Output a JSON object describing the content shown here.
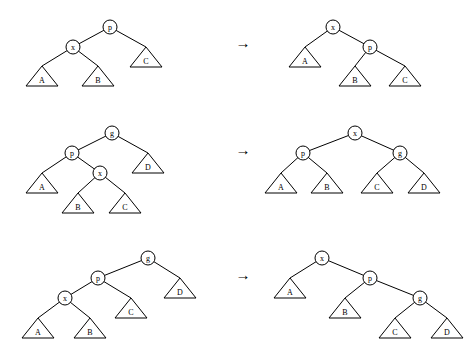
{
  "figure": {
    "title": "",
    "rows": [
      {
        "id": "case-1",
        "arrow": "→",
        "before": {
          "nodes": [
            {
              "id": "p",
              "label": "p",
              "cx": 110,
              "cy": 27
            },
            {
              "id": "x",
              "label": "x",
              "cx": 73,
              "cy": 47
            },
            {
              "id": "A",
              "label": "A",
              "cx": 42,
              "cy": 76,
              "shape": "triangle"
            },
            {
              "id": "B",
              "label": "B",
              "cx": 98,
              "cy": 76,
              "shape": "triangle"
            },
            {
              "id": "C",
              "label": "C",
              "cx": 146,
              "cy": 57,
              "shape": "triangle"
            }
          ],
          "edges": [
            [
              "p",
              "x"
            ],
            [
              "p",
              "C"
            ],
            [
              "x",
              "A"
            ],
            [
              "x",
              "B"
            ]
          ]
        },
        "after": {
          "nodes": [
            {
              "id": "x",
              "label": "x",
              "cx": 333,
              "cy": 27
            },
            {
              "id": "p",
              "label": "p",
              "cx": 370,
              "cy": 47
            },
            {
              "id": "A",
              "label": "A",
              "cx": 305,
              "cy": 57,
              "shape": "triangle"
            },
            {
              "id": "B",
              "label": "B",
              "cx": 355,
              "cy": 76,
              "shape": "triangle"
            },
            {
              "id": "C",
              "label": "C",
              "cx": 405,
              "cy": 76,
              "shape": "triangle"
            }
          ],
          "edges": [
            [
              "x",
              "A"
            ],
            [
              "x",
              "p"
            ],
            [
              "p",
              "B"
            ],
            [
              "p",
              "C"
            ]
          ]
        }
      },
      {
        "id": "case-2",
        "arrow": "→",
        "before": {
          "nodes": [
            {
              "id": "g",
              "label": "g",
              "cx": 112,
              "cy": 133
            },
            {
              "id": "p",
              "label": "p",
              "cx": 72,
              "cy": 153
            },
            {
              "id": "D",
              "label": "D",
              "cx": 148,
              "cy": 163,
              "shape": "triangle"
            },
            {
              "id": "A",
              "label": "A",
              "cx": 42,
              "cy": 183,
              "shape": "triangle"
            },
            {
              "id": "x",
              "label": "x",
              "cx": 100,
              "cy": 173
            },
            {
              "id": "B",
              "label": "B",
              "cx": 78,
              "cy": 203,
              "shape": "triangle"
            },
            {
              "id": "C",
              "label": "C",
              "cx": 125,
              "cy": 203,
              "shape": "triangle"
            }
          ],
          "edges": [
            [
              "g",
              "p"
            ],
            [
              "g",
              "D"
            ],
            [
              "p",
              "A"
            ],
            [
              "p",
              "x"
            ],
            [
              "x",
              "B"
            ],
            [
              "x",
              "C"
            ]
          ]
        },
        "after": {
          "nodes": [
            {
              "id": "x",
              "label": "x",
              "cx": 355,
              "cy": 133
            },
            {
              "id": "p",
              "label": "p",
              "cx": 303,
              "cy": 153
            },
            {
              "id": "g",
              "label": "g",
              "cx": 400,
              "cy": 153
            },
            {
              "id": "A",
              "label": "A",
              "cx": 281,
              "cy": 183,
              "shape": "triangle"
            },
            {
              "id": "B",
              "label": "B",
              "cx": 327,
              "cy": 183,
              "shape": "triangle"
            },
            {
              "id": "C",
              "label": "C",
              "cx": 377,
              "cy": 183,
              "shape": "triangle"
            },
            {
              "id": "D",
              "label": "D",
              "cx": 424,
              "cy": 183,
              "shape": "triangle"
            }
          ],
          "edges": [
            [
              "x",
              "p"
            ],
            [
              "x",
              "g"
            ],
            [
              "p",
              "A"
            ],
            [
              "p",
              "B"
            ],
            [
              "g",
              "C"
            ],
            [
              "g",
              "D"
            ]
          ]
        }
      },
      {
        "id": "case-3",
        "arrow": "→",
        "before": {
          "nodes": [
            {
              "id": "g",
              "label": "g",
              "cx": 148,
              "cy": 258
            },
            {
              "id": "p",
              "label": "p",
              "cx": 98,
              "cy": 278
            },
            {
              "id": "D",
              "label": "D",
              "cx": 180,
              "cy": 288,
              "shape": "triangle"
            },
            {
              "id": "x",
              "label": "x",
              "cx": 65,
              "cy": 298
            },
            {
              "id": "C",
              "label": "C",
              "cx": 131,
              "cy": 308,
              "shape": "triangle"
            },
            {
              "id": "A",
              "label": "A",
              "cx": 38,
              "cy": 328,
              "shape": "triangle"
            },
            {
              "id": "B",
              "label": "B",
              "cx": 90,
              "cy": 328,
              "shape": "triangle"
            }
          ],
          "edges": [
            [
              "g",
              "p"
            ],
            [
              "g",
              "D"
            ],
            [
              "p",
              "x"
            ],
            [
              "p",
              "C"
            ],
            [
              "x",
              "A"
            ],
            [
              "x",
              "B"
            ]
          ]
        },
        "after": {
          "nodes": [
            {
              "id": "x",
              "label": "x",
              "cx": 322,
              "cy": 258
            },
            {
              "id": "A",
              "label": "A",
              "cx": 290,
              "cy": 288,
              "shape": "triangle"
            },
            {
              "id": "p",
              "label": "p",
              "cx": 370,
              "cy": 278
            },
            {
              "id": "B",
              "label": "B",
              "cx": 345,
              "cy": 308,
              "shape": "triangle"
            },
            {
              "id": "g",
              "label": "g",
              "cx": 420,
              "cy": 298
            },
            {
              "id": "C",
              "label": "C",
              "cx": 395,
              "cy": 328,
              "shape": "triangle"
            },
            {
              "id": "D",
              "label": "D",
              "cx": 447,
              "cy": 328,
              "shape": "triangle"
            }
          ],
          "edges": [
            [
              "x",
              "A"
            ],
            [
              "x",
              "p"
            ],
            [
              "p",
              "B"
            ],
            [
              "p",
              "g"
            ],
            [
              "g",
              "C"
            ],
            [
              "g",
              "D"
            ]
          ]
        }
      }
    ],
    "arrows": [
      {
        "id": "arrow-1",
        "x": 243,
        "y": 43,
        "glyph": "→"
      },
      {
        "id": "arrow-2",
        "x": 243,
        "y": 150,
        "glyph": "→"
      },
      {
        "id": "arrow-3",
        "x": 243,
        "y": 275,
        "glyph": "→"
      }
    ],
    "node_radius": 7,
    "triangle": {
      "half_width": 16,
      "height": 20
    },
    "colors": {
      "stroke": "#000000",
      "fill": "#ffffff",
      "background": "#ffffff"
    }
  }
}
